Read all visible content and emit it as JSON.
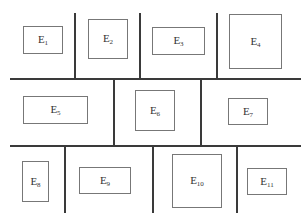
{
  "diagram": {
    "title": "",
    "rows": [
      {
        "row": 1,
        "cells": [
          {
            "letter": "E",
            "index": "1"
          },
          {
            "letter": "E",
            "index": "2"
          },
          {
            "letter": "E",
            "index": "3"
          },
          {
            "letter": "E",
            "index": "4"
          }
        ]
      },
      {
        "row": 2,
        "cells": [
          {
            "letter": "E",
            "index": "5"
          },
          {
            "letter": "E",
            "index": "6"
          },
          {
            "letter": "E",
            "index": "7"
          }
        ]
      },
      {
        "row": 3,
        "cells": [
          {
            "letter": "E",
            "index": "8"
          },
          {
            "letter": "E",
            "index": "9"
          },
          {
            "letter": "E",
            "index": "10"
          },
          {
            "letter": "E",
            "index": "11"
          }
        ]
      }
    ],
    "colors": {
      "line": "#3a3a3a",
      "box_border": "#777777",
      "text": "#333333",
      "background": "#ffffff"
    }
  }
}
